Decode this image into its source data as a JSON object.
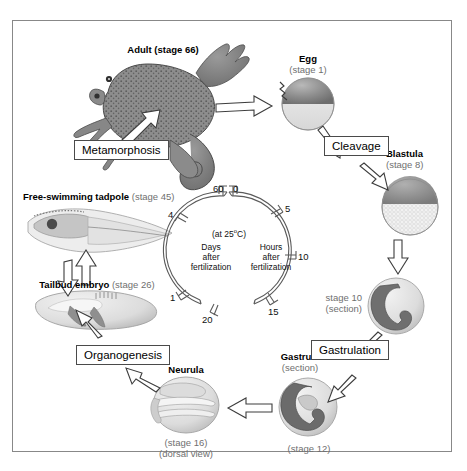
{
  "diagram": {
    "frame_color": "#888888"
  },
  "stages": [
    {
      "id": "adult",
      "name": "Adult",
      "stage": "(stage 66)",
      "extra": ""
    },
    {
      "id": "egg",
      "name": "Egg",
      "stage": "(stage 1)",
      "extra": ""
    },
    {
      "id": "blastula",
      "name": "Blastula",
      "stage": "(stage 8)",
      "extra": ""
    },
    {
      "id": "stage10",
      "name": "stage 10",
      "stage": "(section)",
      "extra": ""
    },
    {
      "id": "gastrula",
      "name": "Gastrula",
      "stage": "(section)",
      "extra": "(stage 12)"
    },
    {
      "id": "neurula",
      "name": "Neurula",
      "stage": "(stage 16)",
      "extra": "(dorsal view)"
    },
    {
      "id": "tailbud",
      "name": "Tailbud embryo",
      "stage": "(stage 26)",
      "extra": ""
    },
    {
      "id": "tadpole",
      "name": "Free-swimming tadpole",
      "stage": "(stage 45)",
      "extra": ""
    }
  ],
  "processes": [
    {
      "id": "cleavage",
      "label": "Cleavage"
    },
    {
      "id": "gastrulation",
      "label": "Gastrulation"
    },
    {
      "id": "organogenesis",
      "label": "Organogenesis"
    },
    {
      "id": "metamorphosis",
      "label": "Metamorphosis"
    }
  ],
  "clock": {
    "temperature": "(at 25",
    "temperature_unit": "C)",
    "degree": "o",
    "hours_label_l1": "Hours",
    "hours_label_l2": "after",
    "hours_label_l3": "fertilization",
    "days_label_l1": "Days",
    "days_label_l2": "after",
    "days_label_l3": "fertilization",
    "hour_ticks": [
      "0",
      "5",
      "10",
      "15",
      "20"
    ],
    "day_ticks": [
      "1",
      "4",
      "60"
    ],
    "tick_0": "0",
    "tick_5": "5",
    "tick_10": "10",
    "tick_15": "15",
    "tick_20": "20",
    "tick_60": "60",
    "tick_d1": "1",
    "tick_d4": "4"
  }
}
